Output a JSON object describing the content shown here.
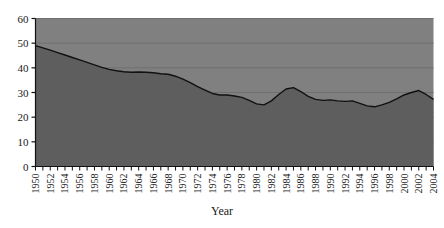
{
  "chart_data": {
    "type": "area",
    "title": "",
    "xlabel": "Year",
    "ylabel": "",
    "ylim": [
      0,
      60
    ],
    "ytick_step": 10,
    "yticks": [
      0,
      10,
      20,
      30,
      40,
      50,
      60
    ],
    "xlim": [
      1950,
      2004
    ],
    "grid": true,
    "grid_axis": "y",
    "legend": "none",
    "tick_interval_years": 1,
    "label_interval_years": 2,
    "x": [
      1950,
      1951,
      1952,
      1953,
      1954,
      1955,
      1956,
      1957,
      1958,
      1959,
      1960,
      1961,
      1962,
      1963,
      1964,
      1965,
      1966,
      1967,
      1968,
      1969,
      1970,
      1971,
      1972,
      1973,
      1974,
      1975,
      1976,
      1977,
      1978,
      1979,
      1980,
      1981,
      1982,
      1983,
      1984,
      1985,
      1986,
      1987,
      1988,
      1989,
      1990,
      1991,
      1992,
      1993,
      1994,
      1995,
      1996,
      1997,
      1998,
      1999,
      2000,
      2001,
      2002,
      2003,
      2004
    ],
    "values": [
      49.0,
      48.1,
      47.2,
      46.2,
      45.2,
      44.2,
      43.2,
      42.2,
      41.2,
      40.2,
      39.4,
      38.8,
      38.4,
      38.2,
      38.3,
      38.2,
      38.0,
      37.6,
      37.4,
      36.6,
      35.4,
      34.0,
      32.4,
      31.0,
      29.6,
      29.0,
      29.0,
      28.6,
      28.0,
      26.8,
      25.4,
      25.0,
      26.6,
      29.2,
      31.4,
      32.0,
      30.4,
      28.4,
      27.2,
      26.8,
      27.0,
      26.6,
      26.4,
      26.6,
      25.6,
      24.6,
      24.2,
      25.0,
      26.0,
      27.4,
      29.0,
      30.0,
      30.8,
      29.2,
      27.2
    ],
    "xticklabels": [
      "1950",
      "1952",
      "1954",
      "1956",
      "1958",
      "1960",
      "1962",
      "1964",
      "1966",
      "1968",
      "1970",
      "1972",
      "1974",
      "1976",
      "1978",
      "1980",
      "1982",
      "1984",
      "1986",
      "1988",
      "1990",
      "1992",
      "1994",
      "1996",
      "1998",
      "2000",
      "2002",
      "2004"
    ],
    "yticklabels": [
      "0",
      "10",
      "20",
      "30",
      "40",
      "50",
      "60"
    ],
    "colors": {
      "area_fill": "#5e5e5e",
      "plot_background": "#808080",
      "line": "#111111",
      "gridline": "#6f6f6f",
      "axis": "#111111",
      "page_background": "#ffffff",
      "text": "#1a1a1a"
    }
  }
}
